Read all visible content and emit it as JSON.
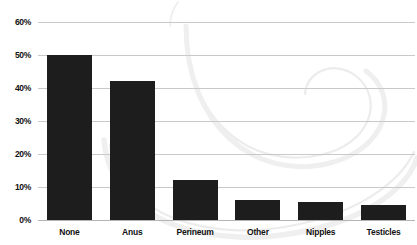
{
  "chart_data": {
    "type": "bar",
    "title": "",
    "subtitle": "",
    "xlabel": "",
    "ylabel": "",
    "categories": [
      "None",
      "Anus",
      "Perineum",
      "Other",
      "Nipples",
      "Testicles"
    ],
    "values": [
      50,
      42,
      12,
      6,
      5.5,
      4.5
    ],
    "series": [
      {
        "name": "",
        "values": [
          50,
          42,
          12,
          6,
          5.5,
          4.5
        ]
      }
    ],
    "ylim": [
      0,
      60
    ],
    "ytick_labels": [
      "0%",
      "10%",
      "20%",
      "30%",
      "40%",
      "50%",
      "60%"
    ],
    "ytick_values": [
      0,
      10,
      20,
      30,
      40,
      50,
      60
    ],
    "grid": "horizontal",
    "legend": "none",
    "annotations": [],
    "colors": {
      "bar": "#1d1d1d",
      "gridline": "#c9c9c9",
      "baseline": "#b4b4b4",
      "background": "#ffffff",
      "watermark": "#e8e8e8",
      "text": "#111111"
    }
  }
}
